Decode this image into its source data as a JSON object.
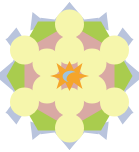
{
  "canvas": {
    "width": 139,
    "height": 152,
    "background": "#ffffff",
    "title": "Geometric Rosette Tiling"
  },
  "palette": {
    "background": "#ffffff",
    "star_points": "#b9c4dd",
    "hexagon_green": "#a9cc4e",
    "inner_hexagon_pink": "#d9a9a4",
    "circle_yellow": "#f6f6ac",
    "center_star_orange": "#f5a52a",
    "center_crescent_blue": "#9fc4dd"
  },
  "layers": {
    "star_layer": {
      "name": "twelve-point-star",
      "point_count": 12,
      "outer_radius": 74,
      "inner_radius": 58,
      "color": "#b9c4dd"
    },
    "hexagon_layer": {
      "name": "outer-hexagon",
      "sides": 6,
      "radius": 63,
      "orientation": "pointy-left-right",
      "color": "#a9cc4e"
    },
    "inner_hexagon_layer": {
      "name": "inner-hexagon",
      "sides": 6,
      "radius": 45,
      "color": "#d9a9a4"
    },
    "circle_layer": {
      "name": "circle-rosette",
      "count": 12,
      "radius": 14.5,
      "ring_radii": [
        25,
        48
      ],
      "color": "#f6f6ac"
    },
    "center_layer": {
      "name": "center-hexagram",
      "outer_radius": 15,
      "inner_radius": 7.5,
      "color": "#f5a52a"
    },
    "crescent_layer": {
      "name": "center-crescent",
      "color": "#9fc4dd"
    }
  },
  "chart_data": {
    "type": "scatter",
    "xlabel": "",
    "ylabel": "",
    "categories": [
      "star-points",
      "outer-hexagon",
      "inner-hexagon",
      "circles",
      "center-hexagram",
      "crescent"
    ],
    "values": [
      12,
      6,
      6,
      12,
      6,
      1
    ],
    "series": [
      {
        "name": "element-count",
        "values": [
          12,
          6,
          6,
          12,
          6,
          1
        ]
      }
    ],
    "annotations": [
      "12-point periwinkle star backdrop",
      "yellow-green hexagon body",
      "pink inner hexagon",
      "12 pale-yellow circles in two rings of 6",
      "orange six-point star at center",
      "pale-blue crescent inside center star"
    ]
  }
}
